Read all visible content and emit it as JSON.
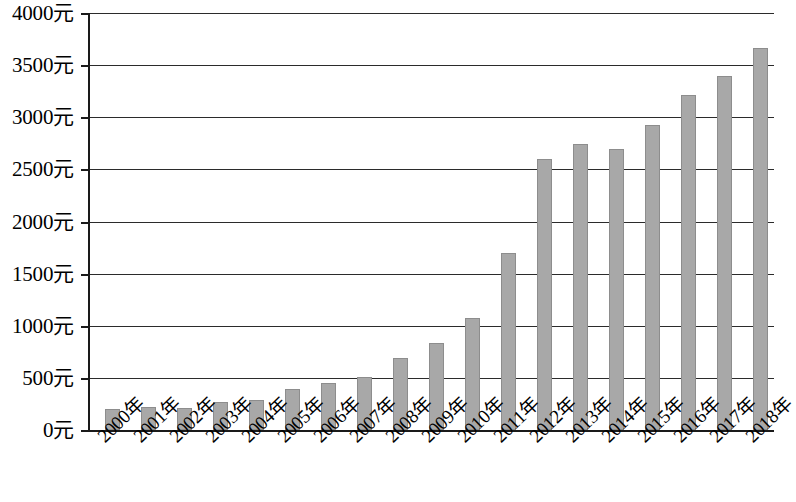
{
  "chart_data": {
    "type": "bar",
    "title": "",
    "subtitle": "",
    "xlabel": "",
    "ylabel": "",
    "unit": "元",
    "categories": [
      "2000年",
      "2001年",
      "2002年",
      "2003年",
      "2004年",
      "2005年",
      "2006年",
      "2007年",
      "2008年",
      "2009年",
      "2010年",
      "2011年",
      "2012年",
      "2013年",
      "2014年",
      "2015年",
      "2016年",
      "2017年",
      "2018年"
    ],
    "values": [
      205,
      225,
      215,
      265,
      290,
      390,
      455,
      505,
      690,
      830,
      1075,
      1700,
      2600,
      2740,
      2700,
      2930,
      3215,
      3400,
      3660
    ],
    "ylim": [
      0,
      4000
    ],
    "ytick_values": [
      0,
      500,
      1000,
      1500,
      2000,
      2500,
      3000,
      3500,
      4000
    ],
    "ytick_labels": [
      "0元",
      "500元",
      "1000元",
      "1500元",
      "2000元",
      "2500元",
      "3000元",
      "3500元",
      "4000元"
    ],
    "grid": true,
    "legend": false,
    "legend_position": "none",
    "bar_color": "#a8a8a8",
    "axis_color": "#1a1a1a",
    "grid_color": "#2b2b2b",
    "xtick_rotation": -44
  }
}
